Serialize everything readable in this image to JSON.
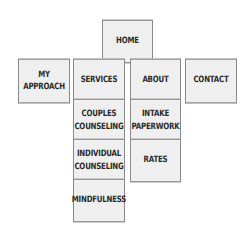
{
  "sitemap": {
    "home": {
      "label": "HOME"
    },
    "level1": [
      {
        "label": "MY\nAPPROACH"
      },
      {
        "label": "SERVICES"
      },
      {
        "label": "ABOUT"
      },
      {
        "label": "CONTACT"
      }
    ],
    "services_children": [
      {
        "label": "COUPLES\nCOUNSELING"
      },
      {
        "label": "INDIVIDUAL\nCOUNSELING"
      },
      {
        "label": "MINDFULNESS"
      }
    ],
    "about_children": [
      {
        "label": "INTAKE\nPAPERWORK"
      },
      {
        "label": "RATES"
      }
    ]
  },
  "colors": {
    "box_fill": "#efefef",
    "box_border": "#8a8a8a",
    "text": "#2a2a2a"
  }
}
